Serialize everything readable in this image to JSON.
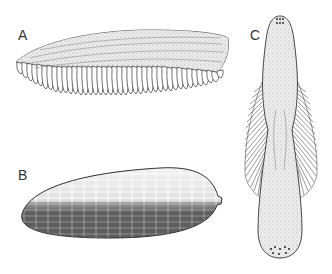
{
  "figure": {
    "panels": [
      {
        "label": "A",
        "subject": "comb-row-like fringed band with many elongated lobes",
        "label_pos": [
          18,
          27
        ]
      },
      {
        "label": "B",
        "subject": "elongated oval body with brick-like cellular pattern",
        "label_pos": [
          18,
          167
        ]
      },
      {
        "label": "C",
        "subject": "elongated stippled body with lateral fringes and dotted ends",
        "label_pos": [
          250,
          27
        ]
      }
    ],
    "colors": {
      "ink": "#333333",
      "stipple": "#b9b9b9",
      "fill_light": "#e6e6e6",
      "fill_dark": "#9a9a9a",
      "background": "#ffffff"
    }
  }
}
